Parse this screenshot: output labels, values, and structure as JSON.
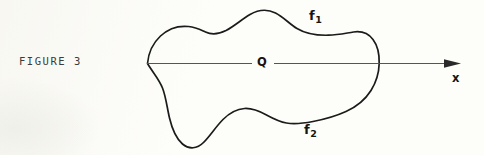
{
  "figure": {
    "caption": "FIGURE 3",
    "background_color": "#fdfdfa",
    "ink_color": "#1b1b1b",
    "axis_color": "#555555"
  },
  "labels": {
    "upper_boundary": {
      "base": "f",
      "subscript": "1",
      "full": "f1"
    },
    "lower_boundary": {
      "base": "f",
      "subscript": "2",
      "full": "f2"
    },
    "interior_point": "Q",
    "axis": "x"
  },
  "geometry": {
    "blob": {
      "description": "closed smooth region",
      "left_x": 147,
      "right_x": 379,
      "top_y": 11,
      "bottom_y": 147
    },
    "axis": {
      "y": 63,
      "start_x": 147,
      "end_x": 461,
      "arrowhead_x": 461,
      "gap_start_x": 252,
      "gap_end_x": 274
    }
  }
}
